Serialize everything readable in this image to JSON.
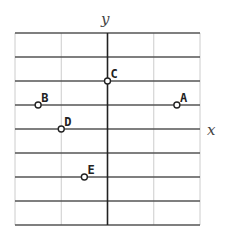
{
  "chart_data": {
    "type": "scatter",
    "title": "",
    "xlabel": "x",
    "ylabel": "y",
    "grid": true,
    "grid_cells": {
      "columns": 4,
      "rows": 8
    },
    "axis_position": {
      "y_axis_column_line": 2,
      "x_axis_row_line": 4
    },
    "points": [
      {
        "label": "A",
        "x": 1.5,
        "y": 1
      },
      {
        "label": "B",
        "x": -1.5,
        "y": 1
      },
      {
        "label": "C",
        "x": 0,
        "y": 2
      },
      {
        "label": "D",
        "x": -1,
        "y": 0
      },
      {
        "label": "E",
        "x": -0.5,
        "y": -2
      }
    ],
    "units_note": "x in grid columns, y in grid rows; no numeric tick labels shown"
  },
  "colors": {
    "horizontal_lines": "#555555",
    "vertical_grid": "#cccccc",
    "y_axis": "#222222",
    "point_fill": "#ffffff",
    "point_stroke": "#222222"
  },
  "labels": {
    "x_axis": "x",
    "y_axis": "y"
  }
}
